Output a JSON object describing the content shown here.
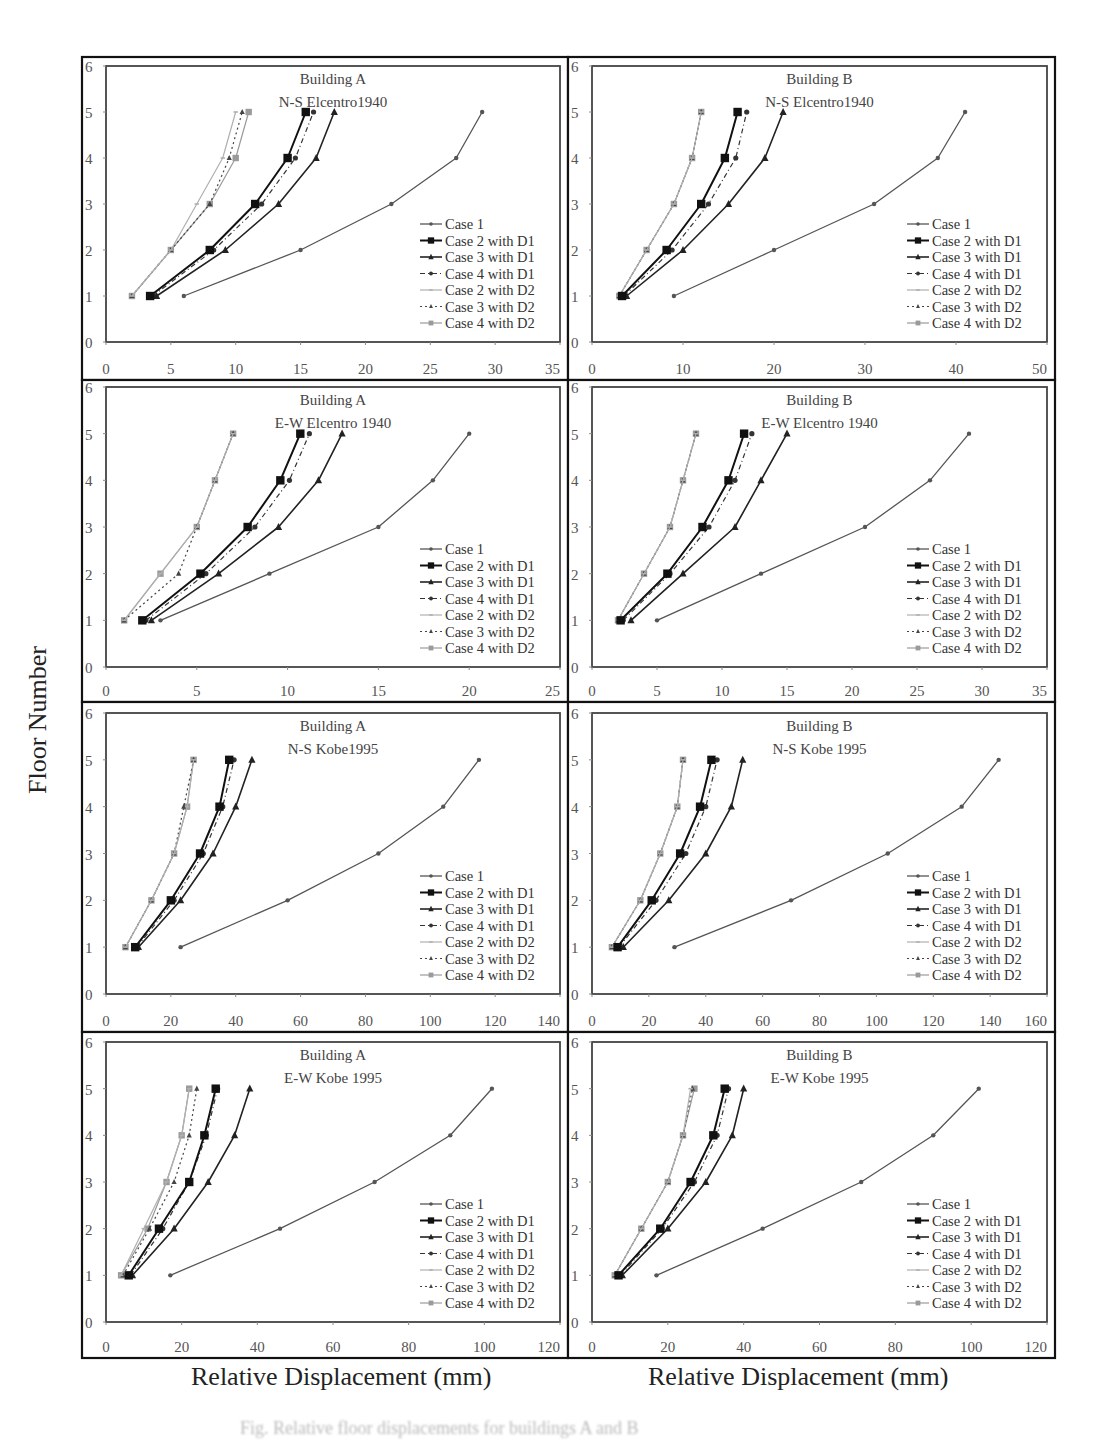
{
  "figure": {
    "y_axis_label": "Floor Number",
    "x_axis_label_left": "Relative Displacement (mm)",
    "x_axis_label_right": "Relative Displacement (mm)",
    "caption": "Fig. Relative floor displacements for buildings A and B"
  },
  "legend": [
    "Case 1",
    "Case 2 with D1",
    "Case 3 with D1",
    "Case 4 with D1",
    "Case 2 with D2",
    "Case 3 with D2",
    "Case 4 with D2"
  ],
  "chart_data": [
    {
      "type": "line",
      "title": "Building A",
      "subtitle": "N-S Elcentro1940",
      "xlabel": "Relative Displacement (mm)",
      "ylabel": "Floor Number",
      "xlim": [
        0,
        35
      ],
      "ylim": [
        0,
        6
      ],
      "xticks": [
        0,
        5,
        10,
        15,
        20,
        25,
        30,
        35
      ],
      "yticks": [
        0,
        1,
        2,
        3,
        4,
        5,
        6
      ],
      "grid": false,
      "legend_position": "lower right",
      "y": [
        1,
        2,
        3,
        4,
        5
      ],
      "series": [
        {
          "name": "Case 1",
          "x": [
            6,
            15,
            22,
            27,
            29
          ]
        },
        {
          "name": "Case 2 with D1",
          "x": [
            3.4,
            8,
            11.5,
            14,
            15.4
          ]
        },
        {
          "name": "Case 3 with D1",
          "x": [
            3.9,
            9.2,
            13.3,
            16.2,
            17.6
          ]
        },
        {
          "name": "Case 4 with D1",
          "x": [
            3.6,
            8.3,
            12,
            14.6,
            16
          ]
        },
        {
          "name": "Case 2 with D2",
          "x": [
            2,
            5,
            7,
            9,
            10
          ]
        },
        {
          "name": "Case 3 with D2",
          "x": [
            2,
            5,
            8,
            9.5,
            10.5
          ]
        },
        {
          "name": "Case 4 with D2",
          "x": [
            2,
            5,
            8,
            10,
            11
          ]
        }
      ]
    },
    {
      "type": "line",
      "title": "Building B",
      "subtitle": "N-S Elcentro1940",
      "xlabel": "Relative Displacement (mm)",
      "ylabel": "Floor Number",
      "xlim": [
        0,
        50
      ],
      "ylim": [
        0,
        6
      ],
      "xticks": [
        0,
        10,
        20,
        30,
        40,
        50
      ],
      "yticks": [
        0,
        1,
        2,
        3,
        4,
        5,
        6
      ],
      "grid": false,
      "legend_position": "lower right",
      "y": [
        1,
        2,
        3,
        4,
        5
      ],
      "series": [
        {
          "name": "Case 1",
          "x": [
            9,
            20,
            31,
            38,
            41
          ]
        },
        {
          "name": "Case 2 with D1",
          "x": [
            3.3,
            8.2,
            12,
            14.6,
            16
          ]
        },
        {
          "name": "Case 3 with D1",
          "x": [
            3.8,
            10,
            15,
            19,
            21
          ]
        },
        {
          "name": "Case 4 with D1",
          "x": [
            3.5,
            8.8,
            12.8,
            15.8,
            17
          ]
        },
        {
          "name": "Case 2 with D2",
          "x": [
            3,
            6,
            9,
            11,
            12
          ]
        },
        {
          "name": "Case 3 with D2",
          "x": [
            3,
            6,
            9,
            11,
            12
          ]
        },
        {
          "name": "Case 4 with D2",
          "x": [
            3,
            6,
            9,
            11,
            12
          ]
        }
      ]
    },
    {
      "type": "line",
      "title": "Building A",
      "subtitle": "E-W Elcentro 1940",
      "xlabel": "Relative Displacement (mm)",
      "ylabel": "Floor Number",
      "xlim": [
        0,
        25
      ],
      "ylim": [
        0,
        6
      ],
      "xticks": [
        0,
        5,
        10,
        15,
        20,
        25
      ],
      "yticks": [
        0,
        1,
        2,
        3,
        4,
        5,
        6
      ],
      "grid": false,
      "legend_position": "lower right",
      "y": [
        1,
        2,
        3,
        4,
        5
      ],
      "series": [
        {
          "name": "Case 1",
          "x": [
            3,
            9,
            15,
            18,
            20
          ]
        },
        {
          "name": "Case 2 with D1",
          "x": [
            2,
            5.2,
            7.8,
            9.6,
            10.7
          ]
        },
        {
          "name": "Case 3 with D1",
          "x": [
            2.5,
            6.2,
            9.5,
            11.7,
            13
          ]
        },
        {
          "name": "Case 4 with D1",
          "x": [
            2.2,
            5.5,
            8.2,
            10.1,
            11.2
          ]
        },
        {
          "name": "Case 2 with D2",
          "x": [
            1,
            3,
            5,
            6,
            7
          ]
        },
        {
          "name": "Case 3 with D2",
          "x": [
            1,
            4,
            5,
            6,
            7
          ]
        },
        {
          "name": "Case 4 with D2",
          "x": [
            1,
            3,
            5,
            6,
            7
          ]
        }
      ]
    },
    {
      "type": "line",
      "title": "Building B",
      "subtitle": "E-W Elcentro 1940",
      "xlabel": "Relative Displacement (mm)",
      "ylabel": "Floor Number",
      "xlim": [
        0,
        35
      ],
      "ylim": [
        0,
        6
      ],
      "xticks": [
        0,
        5,
        10,
        15,
        20,
        25,
        30,
        35
      ],
      "yticks": [
        0,
        1,
        2,
        3,
        4,
        5,
        6
      ],
      "grid": false,
      "legend_position": "lower right",
      "y": [
        1,
        2,
        3,
        4,
        5
      ],
      "series": [
        {
          "name": "Case 1",
          "x": [
            5,
            13,
            21,
            26,
            29
          ]
        },
        {
          "name": "Case 2 with D1",
          "x": [
            2.2,
            5.8,
            8.5,
            10.5,
            11.7
          ]
        },
        {
          "name": "Case 3 with D1",
          "x": [
            3,
            7,
            11,
            13,
            15
          ]
        },
        {
          "name": "Case 4 with D1",
          "x": [
            2.4,
            6,
            9,
            11,
            12.3
          ]
        },
        {
          "name": "Case 2 with D2",
          "x": [
            2,
            4,
            6,
            7,
            8
          ]
        },
        {
          "name": "Case 3 with D2",
          "x": [
            2,
            4,
            6,
            7,
            8
          ]
        },
        {
          "name": "Case 4 with D2",
          "x": [
            2,
            4,
            6,
            7,
            8
          ]
        }
      ]
    },
    {
      "type": "line",
      "title": "Building A",
      "subtitle": "N-S Kobe1995",
      "xlabel": "Relative Displacement (mm)",
      "ylabel": "Floor Number",
      "xlim": [
        0,
        140
      ],
      "ylim": [
        0,
        6
      ],
      "xticks": [
        0,
        20,
        40,
        60,
        80,
        100,
        120,
        140
      ],
      "yticks": [
        0,
        1,
        2,
        3,
        4,
        5,
        6
      ],
      "grid": false,
      "legend_position": "lower right",
      "y": [
        1,
        2,
        3,
        4,
        5
      ],
      "series": [
        {
          "name": "Case 1",
          "x": [
            23,
            56,
            84,
            104,
            115
          ]
        },
        {
          "name": "Case 2 with D1",
          "x": [
            9,
            20,
            29,
            35,
            38
          ]
        },
        {
          "name": "Case 3 with D1",
          "x": [
            10,
            23,
            33,
            40,
            45
          ]
        },
        {
          "name": "Case 4 with D1",
          "x": [
            9.5,
            21,
            30,
            36,
            39.5
          ]
        },
        {
          "name": "Case 2 with D2",
          "x": [
            6,
            14,
            21,
            25,
            27
          ]
        },
        {
          "name": "Case 3 with D2",
          "x": [
            6,
            14,
            21,
            24,
            27
          ]
        },
        {
          "name": "Case 4 with D2",
          "x": [
            6,
            14,
            21,
            25,
            27
          ]
        }
      ]
    },
    {
      "type": "line",
      "title": "Building B",
      "subtitle": "N-S Kobe 1995",
      "xlabel": "Relative Displacement (mm)",
      "ylabel": "Floor Number",
      "xlim": [
        0,
        160
      ],
      "ylim": [
        0,
        6
      ],
      "xticks": [
        0,
        20,
        40,
        60,
        80,
        100,
        120,
        140,
        160
      ],
      "yticks": [
        0,
        1,
        2,
        3,
        4,
        5,
        6
      ],
      "grid": false,
      "legend_position": "lower right",
      "y": [
        1,
        2,
        3,
        4,
        5
      ],
      "series": [
        {
          "name": "Case 1",
          "x": [
            29,
            70,
            104,
            130,
            143
          ]
        },
        {
          "name": "Case 2 with D1",
          "x": [
            9,
            21,
            31,
            38,
            42
          ]
        },
        {
          "name": "Case 3 with D1",
          "x": [
            11,
            27,
            40,
            49,
            53
          ]
        },
        {
          "name": "Case 4 with D1",
          "x": [
            9.5,
            22.5,
            33,
            40,
            44
          ]
        },
        {
          "name": "Case 2 with D2",
          "x": [
            7,
            17,
            24,
            30,
            32
          ]
        },
        {
          "name": "Case 3 with D2",
          "x": [
            7,
            17,
            24,
            30,
            32
          ]
        },
        {
          "name": "Case 4 with D2",
          "x": [
            7,
            17,
            24,
            30,
            32
          ]
        }
      ]
    },
    {
      "type": "line",
      "title": "Building A",
      "subtitle": "E-W Kobe 1995",
      "xlabel": "Relative Displacement (mm)",
      "ylabel": "Floor Number",
      "xlim": [
        0,
        120
      ],
      "ylim": [
        0,
        6
      ],
      "xticks": [
        0,
        20,
        40,
        60,
        80,
        100,
        120
      ],
      "yticks": [
        0,
        1,
        2,
        3,
        4,
        5,
        6
      ],
      "grid": false,
      "legend_position": "lower right",
      "y": [
        1,
        2,
        3,
        4,
        5
      ],
      "series": [
        {
          "name": "Case 1",
          "x": [
            17,
            46,
            71,
            91,
            102
          ]
        },
        {
          "name": "Case 2 with D1",
          "x": [
            6,
            14,
            22,
            26,
            29
          ]
        },
        {
          "name": "Case 3 with D1",
          "x": [
            7,
            18,
            27,
            34,
            38
          ]
        },
        {
          "name": "Case 4 with D1",
          "x": [
            6.5,
            15,
            22,
            26.5,
            29.5
          ]
        },
        {
          "name": "Case 2 with D2",
          "x": [
            4,
            10,
            16,
            20,
            22
          ]
        },
        {
          "name": "Case 3 with D2",
          "x": [
            4.5,
            11.5,
            18,
            22,
            24
          ]
        },
        {
          "name": "Case 4 with D2",
          "x": [
            4,
            11,
            16,
            20,
            22
          ]
        }
      ]
    },
    {
      "type": "line",
      "title": "Building B",
      "subtitle": "E-W Kobe 1995",
      "xlabel": "Relative Displacement (mm)",
      "ylabel": "Floor Number",
      "xlim": [
        0,
        120
      ],
      "ylim": [
        0,
        6
      ],
      "xticks": [
        0,
        20,
        40,
        60,
        80,
        100,
        120
      ],
      "yticks": [
        0,
        1,
        2,
        3,
        4,
        5,
        6
      ],
      "grid": false,
      "legend_position": "lower right",
      "y": [
        1,
        2,
        3,
        4,
        5
      ],
      "series": [
        {
          "name": "Case 1",
          "x": [
            17,
            45,
            71,
            90,
            102
          ]
        },
        {
          "name": "Case 2 with D1",
          "x": [
            7,
            18,
            26,
            32,
            35
          ]
        },
        {
          "name": "Case 3 with D1",
          "x": [
            8,
            20,
            30,
            37,
            40
          ]
        },
        {
          "name": "Case 4 with D1",
          "x": [
            7.5,
            18.5,
            27,
            33,
            36
          ]
        },
        {
          "name": "Case 2 with D2",
          "x": [
            6,
            13,
            20,
            24,
            26
          ]
        },
        {
          "name": "Case 3 with D2",
          "x": [
            6,
            13,
            20,
            24,
            26.5
          ]
        },
        {
          "name": "Case 4 with D2",
          "x": [
            6,
            13,
            20,
            24,
            27
          ]
        }
      ]
    }
  ],
  "panels_layout": [
    {
      "outer": [
        82,
        57,
        568,
        380
      ],
      "plot": [
        106,
        66,
        560,
        342
      ]
    },
    {
      "outer": [
        568,
        57,
        1055,
        380
      ],
      "plot": [
        592,
        66,
        1047,
        342
      ]
    },
    {
      "outer": [
        82,
        380,
        568,
        702
      ],
      "plot": [
        106,
        387,
        560,
        667
      ]
    },
    {
      "outer": [
        568,
        380,
        1055,
        702
      ],
      "plot": [
        592,
        387,
        1047,
        667
      ]
    },
    {
      "outer": [
        82,
        702,
        568,
        1032
      ],
      "plot": [
        106,
        713,
        560,
        994
      ]
    },
    {
      "outer": [
        568,
        702,
        1055,
        1032
      ],
      "plot": [
        592,
        713,
        1047,
        994
      ]
    },
    {
      "outer": [
        82,
        1032,
        568,
        1358
      ],
      "plot": [
        106,
        1042,
        560,
        1322
      ]
    },
    {
      "outer": [
        568,
        1032,
        1055,
        1358
      ],
      "plot": [
        592,
        1042,
        1047,
        1322
      ]
    }
  ],
  "series_styles": [
    {
      "color": "#555555",
      "width": 1.3,
      "dash": "",
      "marker": "dot",
      "msize": 2.2
    },
    {
      "color": "#111111",
      "width": 2.0,
      "dash": "",
      "marker": "square",
      "msize": 4.2
    },
    {
      "color": "#222222",
      "width": 1.6,
      "dash": "",
      "marker": "triangle",
      "msize": 3.6
    },
    {
      "color": "#333333",
      "width": 1.2,
      "dash": "5,3,1,3",
      "marker": "dot",
      "msize": 2.6
    },
    {
      "color": "#b0b0b0",
      "width": 1.2,
      "dash": "",
      "marker": "dash",
      "msize": 2.2
    },
    {
      "color": "#444444",
      "width": 1.2,
      "dash": "2,3",
      "marker": "triangle",
      "msize": 2.6
    },
    {
      "color": "#9a9a9a",
      "width": 1.2,
      "dash": "",
      "marker": "square",
      "msize": 3.2
    }
  ]
}
